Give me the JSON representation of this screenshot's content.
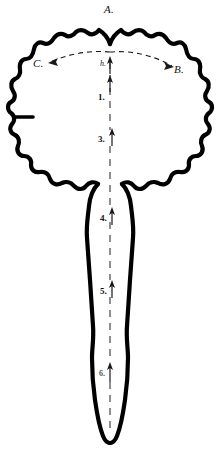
{
  "figure": {
    "background_color": "#ffffff",
    "ink_color": "#000000",
    "width": 220,
    "height": 451
  },
  "labels": {
    "apex": "A.",
    "right_arc": "B.",
    "left_arc": "C.",
    "center_point": "h.",
    "level_1": "1.",
    "level_2": "2.",
    "level_3": "3.",
    "level_4": "4.",
    "level_5": "5.",
    "level_6": "6."
  },
  "annotations": {
    "dashed_arc": {
      "style": "dashed",
      "arrowheads": [
        "left-end",
        "right-end"
      ],
      "from": "h.",
      "to_left": "C.",
      "to_right": "B."
    },
    "midline_axis": {
      "style": "dashed-vertical",
      "arrow_direction": "up",
      "markers": [
        "1.",
        "2.",
        "3.",
        "4.",
        "5.",
        "6."
      ]
    }
  }
}
